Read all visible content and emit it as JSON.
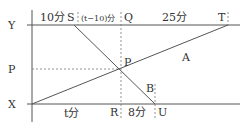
{
  "diagram": {
    "axis_labels": {
      "y": "Y",
      "p": "P",
      "x": "X"
    },
    "top_points": {
      "s": "S",
      "q": "Q",
      "t": "T"
    },
    "bottom_points": {
      "r": "R",
      "u": "U"
    },
    "intersection": "P",
    "lines": {
      "a": "A",
      "b": "B"
    },
    "top_segments": {
      "seg1": "10分",
      "seg2": "(t−10)分",
      "seg3": "25分"
    },
    "bottom_segments": {
      "seg1": "t分",
      "seg2": "8分"
    }
  }
}
